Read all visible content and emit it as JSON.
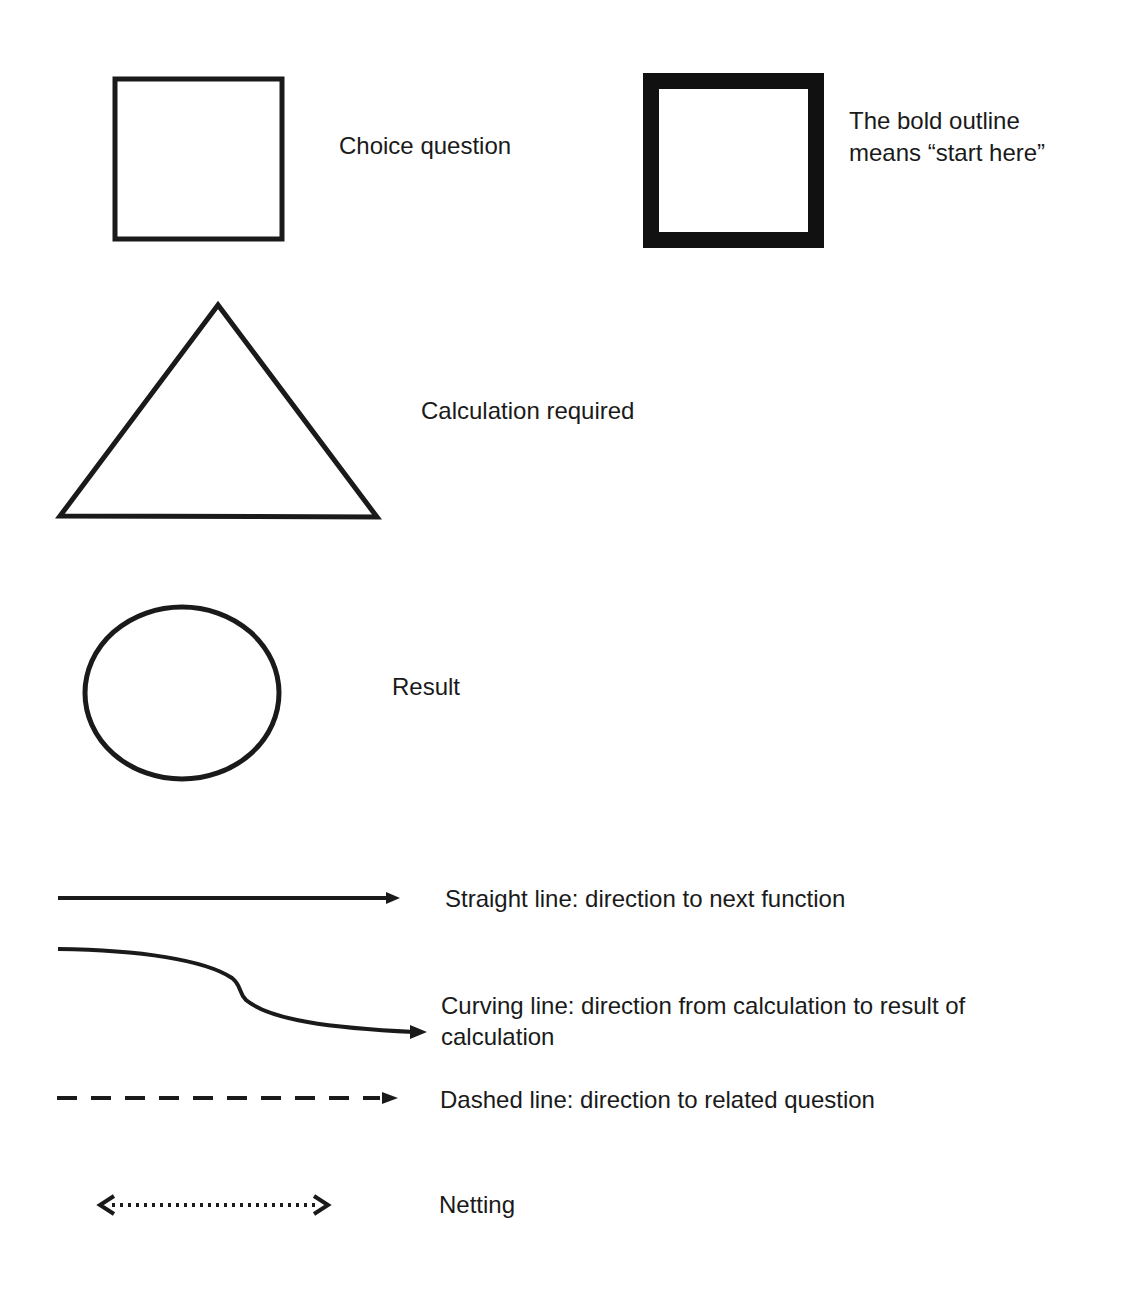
{
  "legend": {
    "items": [
      {
        "symbol": "square-icon",
        "label": "Choice question"
      },
      {
        "symbol": "bold-square-icon",
        "label_line1": "The bold outline",
        "label_line2": "means “start here”"
      },
      {
        "symbol": "triangle-icon",
        "label": "Calculation required"
      },
      {
        "symbol": "circle-icon",
        "label": "Result"
      },
      {
        "symbol": "straight-arrow-icon",
        "label": "Straight line: direction to next function"
      },
      {
        "symbol": "curved-arrow-icon",
        "label_line1": "Curving line: direction from calculation to result of",
        "label_line2": "calculation"
      },
      {
        "symbol": "dashed-arrow-icon",
        "label": "Dashed line: direction to related question"
      },
      {
        "symbol": "dotted-double-arrow-icon",
        "label": "Netting"
      }
    ],
    "colors": {
      "stroke": "#1a1a1a",
      "background": "#ffffff"
    }
  }
}
